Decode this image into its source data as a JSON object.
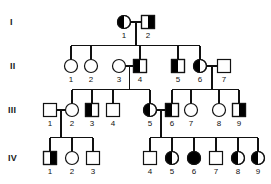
{
  "chart_data": {
    "type": "diagram",
    "generations": [
      "I",
      "II",
      "III",
      "IV"
    ],
    "symbol_legend": {
      "circle": "female",
      "square": "male",
      "open": "unaffected",
      "half-filled": "carrier / heterozygous",
      "filled": "affected"
    },
    "individuals": [
      {
        "gen": "I",
        "id": "1",
        "sex": "female",
        "fill": "half-left",
        "x": 124,
        "y": 22
      },
      {
        "gen": "I",
        "id": "2",
        "sex": "male",
        "fill": "half-right",
        "x": 148,
        "y": 22
      },
      {
        "gen": "II",
        "id": "1",
        "sex": "female",
        "fill": "open",
        "x": 71,
        "y": 66
      },
      {
        "gen": "II",
        "id": "2",
        "sex": "female",
        "fill": "open",
        "x": 91,
        "y": 66
      },
      {
        "gen": "II",
        "id": "3",
        "sex": "female",
        "fill": "open",
        "x": 119,
        "y": 66
      },
      {
        "gen": "II",
        "id": "4",
        "sex": "male",
        "fill": "half-left",
        "x": 140,
        "y": 66
      },
      {
        "gen": "II",
        "id": "5",
        "sex": "male",
        "fill": "half-left",
        "x": 178,
        "y": 66
      },
      {
        "gen": "II",
        "id": "6",
        "sex": "female",
        "fill": "half-left",
        "x": 200,
        "y": 66
      },
      {
        "gen": "II",
        "id": "7",
        "sex": "male",
        "fill": "open",
        "x": 224,
        "y": 66
      },
      {
        "gen": "III",
        "id": "1",
        "sex": "male",
        "fill": "open",
        "x": 50,
        "y": 110
      },
      {
        "gen": "III",
        "id": "2",
        "sex": "female",
        "fill": "open",
        "x": 72,
        "y": 110
      },
      {
        "gen": "III",
        "id": "3",
        "sex": "male",
        "fill": "half-left",
        "x": 92,
        "y": 110
      },
      {
        "gen": "III",
        "id": "4",
        "sex": "male",
        "fill": "open",
        "x": 113,
        "y": 110
      },
      {
        "gen": "III",
        "id": "5",
        "sex": "female",
        "fill": "half-left",
        "x": 150,
        "y": 110
      },
      {
        "gen": "III",
        "id": "6",
        "sex": "male",
        "fill": "half-left",
        "x": 172,
        "y": 110
      },
      {
        "gen": "III",
        "id": "7",
        "sex": "female",
        "fill": "open",
        "x": 191,
        "y": 110
      },
      {
        "gen": "III",
        "id": "8",
        "sex": "female",
        "fill": "open",
        "x": 219,
        "y": 110
      },
      {
        "gen": "III",
        "id": "9",
        "sex": "male",
        "fill": "half-right",
        "x": 239,
        "y": 110
      },
      {
        "gen": "IV",
        "id": "1",
        "sex": "male",
        "fill": "half-right",
        "x": 50,
        "y": 158
      },
      {
        "gen": "IV",
        "id": "2",
        "sex": "female",
        "fill": "open",
        "x": 72,
        "y": 158
      },
      {
        "gen": "IV",
        "id": "3",
        "sex": "male",
        "fill": "open",
        "x": 93,
        "y": 158
      },
      {
        "gen": "IV",
        "id": "4",
        "sex": "male",
        "fill": "open",
        "x": 150,
        "y": 158
      },
      {
        "gen": "IV",
        "id": "5",
        "sex": "female",
        "fill": "half-left",
        "x": 172,
        "y": 158
      },
      {
        "gen": "IV",
        "id": "6",
        "sex": "female",
        "fill": "filled",
        "x": 194,
        "y": 158
      },
      {
        "gen": "IV",
        "id": "7",
        "sex": "male",
        "fill": "open",
        "x": 216,
        "y": 158
      },
      {
        "gen": "IV",
        "id": "8",
        "sex": "female",
        "fill": "half-left",
        "x": 238,
        "y": 158
      },
      {
        "gen": "IV",
        "id": "9",
        "sex": "female",
        "fill": "half-left",
        "x": 258,
        "y": 158
      }
    ],
    "matings": [
      {
        "partners": [
          "I-1",
          "I-2"
        ],
        "children": [
          "II-1",
          "II-2",
          "II-4",
          "II-5",
          "II-6"
        ]
      },
      {
        "partners": [
          "II-3",
          "II-4"
        ],
        "children": [
          "III-2",
          "III-3",
          "III-4",
          "III-5"
        ]
      },
      {
        "partners": [
          "II-6",
          "II-7"
        ],
        "children": [
          "III-6",
          "III-7",
          "III-8",
          "III-9"
        ]
      },
      {
        "partners": [
          "III-1",
          "III-2"
        ],
        "children": [
          "IV-1",
          "IV-2",
          "IV-3"
        ]
      },
      {
        "partners": [
          "III-5",
          "III-6"
        ],
        "children": [
          "IV-4",
          "IV-5",
          "IV-6",
          "IV-7",
          "IV-8",
          "IV-9"
        ]
      }
    ],
    "gen_label_positions": [
      {
        "label": "I",
        "x": 10,
        "y": 17
      },
      {
        "label": "II",
        "x": 10,
        "y": 61
      },
      {
        "label": "III",
        "x": 8,
        "y": 105
      },
      {
        "label": "IV",
        "x": 8,
        "y": 153
      }
    ],
    "colors": {
      "stroke": "#111111",
      "fill_affected": "#000000",
      "background": "#ffffff",
      "text": "#111111"
    },
    "geometry": {
      "symbol_size": 13,
      "stroke_width": 1.2,
      "label_offset_y": 11
    }
  }
}
